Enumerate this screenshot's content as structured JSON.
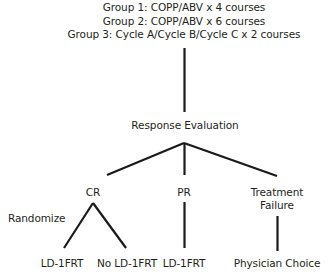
{
  "diagram": {
    "type": "clinical-trial-flow-chart",
    "line_color": "#1a1a1a",
    "text_color": "#231f20",
    "background": "#ffffff",
    "treatment_groups": [
      "Group 1: COPP/ABV x 4 courses",
      "Group 2: COPP/ABV x 6 courses",
      "Group 3: Cycle A/Cycle B/Cycle C x 2 courses"
    ],
    "response_node": "Response Evaluation",
    "response_branches": [
      {
        "id": "cr",
        "label": "CR"
      },
      {
        "id": "pr",
        "label": "PR"
      },
      {
        "id": "tf",
        "label_line1": "Treatment",
        "label_line2": "Failure"
      }
    ],
    "randomize_label": "Randomize",
    "outcomes": [
      {
        "id": "cr-ldfrt",
        "label": "LD-1FRT"
      },
      {
        "id": "cr-no-ldfrt",
        "label": "No LD-1FRT"
      },
      {
        "id": "pr-ldfrt",
        "label": "LD-1FRT"
      },
      {
        "id": "tf-physician",
        "label": "Physician Choice"
      }
    ]
  }
}
